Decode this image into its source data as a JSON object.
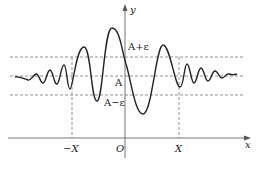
{
  "figure": {
    "type": "function-convergence-diagram",
    "axes": {
      "x_label": "x",
      "y_label": "y",
      "origin_label": "O"
    },
    "horizontal_levels": [
      {
        "name": "upper-bound",
        "label": "A+ε"
      },
      {
        "name": "limit",
        "label": "A"
      },
      {
        "name": "lower-bound",
        "label": "A−ε"
      }
    ],
    "vertical_markers": [
      {
        "name": "neg-X",
        "label": "−X"
      },
      {
        "name": "pos-X",
        "label": "X"
      }
    ],
    "curve": {
      "description": "Oscillating curve with amplitude decaying toward A as |x| grows; stays within A±ε for |x| > X",
      "color": "#222222"
    },
    "colors": {
      "axis": "#555555",
      "dashed": "#666666",
      "curve": "#222222",
      "background": "#ffffff"
    }
  }
}
